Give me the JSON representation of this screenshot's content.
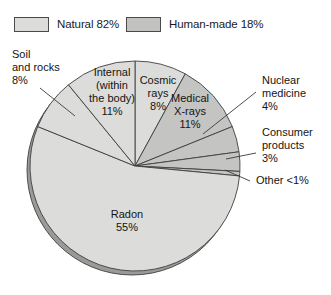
{
  "legend": {
    "items": [
      {
        "label": "Natural 82%",
        "swatch": "natural-swatch",
        "color": "#dcdcda"
      },
      {
        "label": "Human-made 18%",
        "swatch": "human-made-swatch",
        "color": "#c2c2c0"
      }
    ]
  },
  "chart_data": {
    "type": "pie",
    "title": "",
    "start_angle_deg": 0,
    "direction": "clockwise",
    "center": {
      "x": 135,
      "y": 130
    },
    "radius": 105,
    "categories": [
      "Cosmic rays",
      "Medical X-rays",
      "Nuclear medicine",
      "Consumer products",
      "Other",
      "Radon",
      "Soil and rocks",
      "Internal (within the body)"
    ],
    "values": [
      8,
      11,
      4,
      3,
      0.7,
      55,
      8,
      11
    ],
    "slices": [
      {
        "name": "Cosmic rays",
        "value": 8,
        "value_text": "8%",
        "label_lines": [
          "Cosmic",
          "rays",
          "8%"
        ],
        "group": "Natural",
        "color": "#dcdcda",
        "label_mode": "inside",
        "label_x": 158,
        "label_y": 48
      },
      {
        "name": "Medical X-rays",
        "value": 11,
        "value_text": "11%",
        "label_lines": [
          "Medical",
          "X-rays",
          "11%"
        ],
        "group": "Human-made",
        "color": "#c4c4c2",
        "label_mode": "inside",
        "label_x": 190,
        "label_y": 66
      },
      {
        "name": "Nuclear medicine",
        "value": 4,
        "value_text": "4%",
        "label_lines": [
          "Nuclear",
          "medicine",
          "4%"
        ],
        "group": "Human-made",
        "color": "#c4c4c2",
        "label_mode": "callout",
        "label_x": 262,
        "label_y": 48,
        "leader": {
          "x1": 203,
          "y1": 98,
          "x2": 256,
          "y2": 56
        }
      },
      {
        "name": "Consumer products",
        "value": 3,
        "value_text": "3%",
        "label_lines": [
          "Consumer",
          "products",
          "3%"
        ],
        "group": "Human-made",
        "color": "#c4c4c2",
        "label_mode": "callout",
        "label_x": 262,
        "label_y": 100,
        "leader": {
          "x1": 226,
          "y1": 123,
          "x2": 256,
          "y2": 117
        }
      },
      {
        "name": "Other",
        "value": 0.7,
        "value_text": "<1%",
        "label_lines": [
          "Other <1%"
        ],
        "group": "Human-made",
        "color": "#c4c4c2",
        "label_mode": "callout",
        "label_x": 256,
        "label_y": 148,
        "leader": {
          "x1": 225,
          "y1": 134,
          "x2": 250,
          "y2": 145
        }
      },
      {
        "name": "Radon",
        "value": 55,
        "value_text": "55%",
        "label_lines": [
          "Radon",
          "55%"
        ],
        "group": "Natural",
        "color": "#dcdcda",
        "label_mode": "inside",
        "label_x": 127,
        "label_y": 182
      },
      {
        "name": "Soil and rocks",
        "value": 8,
        "value_text": "8%",
        "label_lines": [
          "Soil",
          "and rocks",
          "8%"
        ],
        "group": "Natural",
        "color": "#dcdcda",
        "label_mode": "callout",
        "label_x": 12,
        "label_y": 22,
        "leader": {
          "x1": 40,
          "y1": 52,
          "x2": 75,
          "y2": 80
        }
      },
      {
        "name": "Internal (within the body)",
        "value": 11,
        "value_text": "11%",
        "label_lines": [
          "Internal",
          "(within",
          "the body)",
          "11%"
        ],
        "group": "Natural",
        "color": "#dcdcda",
        "label_mode": "inside",
        "label_x": 112,
        "label_y": 40
      }
    ],
    "legend_groups": [
      {
        "name": "Natural",
        "value": 82,
        "label": "Natural 82%"
      },
      {
        "name": "Human-made",
        "value": 18,
        "label": "Human-made 18%"
      }
    ],
    "colors": {
      "natural": "#dcdcda",
      "human_made": "#c4c4c2",
      "outline": "#3f3f3f",
      "depth_shadow": "#9a9a98",
      "background": "#ffffff"
    }
  }
}
